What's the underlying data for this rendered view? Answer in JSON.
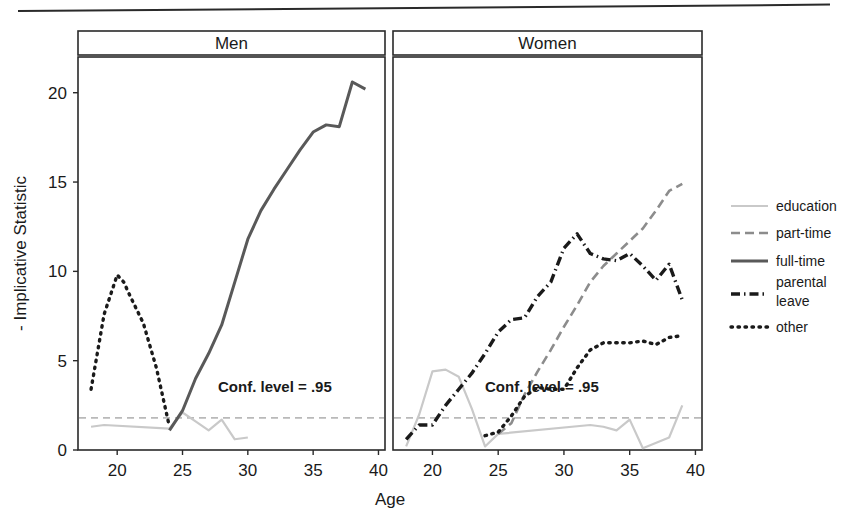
{
  "figure": {
    "top_rule": true,
    "background": "#ffffff"
  },
  "chart_data": {
    "type": "line",
    "title": "",
    "xlabel": "Age",
    "ylabel": "- Implicative Statistic",
    "xlim": [
      17,
      40.5
    ],
    "ylim": [
      0,
      22
    ],
    "xticks": [
      20,
      25,
      30,
      35,
      40
    ],
    "yticks": [
      0,
      5,
      10,
      15,
      20
    ],
    "grid": false,
    "legend_position": "right",
    "panels": [
      {
        "strip_label": "Men",
        "annotation": "Conf. level = .95",
        "series": [
          {
            "name": "education",
            "x": [
              18,
              19,
              24,
              25,
              26,
              27,
              28,
              29,
              30
            ],
            "values": [
              1.3,
              1.4,
              1.2,
              2.1,
              1.6,
              1.1,
              1.7,
              0.6,
              0.7
            ]
          },
          {
            "name": "part-time",
            "x": [],
            "values": []
          },
          {
            "name": "full-time",
            "x": [
              24,
              25,
              26,
              27,
              28,
              29,
              30,
              31,
              32,
              33,
              34,
              35,
              36,
              37,
              38,
              39
            ],
            "values": [
              1.1,
              2.2,
              4.0,
              5.4,
              7.0,
              9.4,
              11.8,
              13.4,
              14.6,
              15.7,
              16.8,
              17.8,
              18.2,
              18.1,
              20.6,
              20.2
            ]
          },
          {
            "name": "parental leave",
            "x": [],
            "values": []
          },
          {
            "name": "other",
            "x": [
              18,
              19,
              20,
              20.5,
              21,
              22,
              23,
              24
            ],
            "values": [
              3.4,
              7.6,
              9.8,
              9.4,
              8.6,
              7.1,
              4.6,
              1.3
            ]
          }
        ]
      },
      {
        "strip_label": "Women",
        "annotation": "Conf. level = .95",
        "series": [
          {
            "name": "education",
            "x": [
              18,
              19,
              20,
              21,
              22,
              23,
              24,
              25,
              32,
              33,
              34,
              35,
              36,
              38,
              39
            ],
            "values": [
              0.2,
              2.0,
              4.4,
              4.5,
              4.1,
              2.3,
              0.2,
              0.9,
              1.4,
              1.3,
              1.1,
              1.7,
              0.1,
              0.7,
              2.5
            ]
          },
          {
            "name": "part-time",
            "x": [
              25,
              26,
              27,
              28,
              29,
              30,
              31,
              32,
              33,
              34,
              35,
              36,
              37,
              38,
              39
            ],
            "values": [
              0.9,
              1.5,
              3.1,
              4.4,
              5.6,
              6.9,
              8.1,
              9.4,
              10.3,
              11.0,
              11.7,
              12.4,
              13.4,
              14.5,
              14.9
            ]
          },
          {
            "name": "full-time",
            "x": [],
            "values": []
          },
          {
            "name": "parental leave",
            "x": [
              18,
              19,
              20,
              21,
              22,
              23,
              24,
              25,
              26,
              27,
              28,
              29,
              30,
              31,
              32,
              33,
              34,
              35,
              36,
              37,
              38,
              39
            ],
            "values": [
              0.6,
              1.4,
              1.4,
              2.5,
              3.4,
              4.3,
              5.4,
              6.6,
              7.3,
              7.4,
              8.6,
              9.4,
              11.3,
              12.1,
              11.0,
              10.7,
              10.6,
              11.0,
              10.3,
              9.5,
              10.4,
              8.4
            ]
          },
          {
            "name": "other",
            "x": [
              24,
              25,
              26,
              27,
              28,
              29,
              30,
              31,
              32,
              33,
              34,
              35,
              36,
              37,
              38,
              39
            ],
            "values": [
              0.8,
              1.0,
              1.9,
              3.0,
              3.5,
              3.4,
              3.4,
              4.6,
              5.6,
              6.0,
              6.0,
              6.0,
              6.1,
              5.9,
              6.3,
              6.4
            ]
          }
        ]
      }
    ],
    "reference_line": {
      "label": "Conf. level = .95",
      "y": 1.8,
      "style": "dashed",
      "color": "#b9b9b9"
    },
    "legend": [
      {
        "label": "education",
        "style": "solid-thin",
        "color": "#c9c9c9"
      },
      {
        "label": "part-time",
        "style": "dashed",
        "color": "#8c8c8c"
      },
      {
        "label": "full-time",
        "style": "solid-thick",
        "color": "#595959"
      },
      {
        "label": "parental leave",
        "style": "dashdot",
        "color": "#1a1a1a"
      },
      {
        "label": "other",
        "style": "dotted",
        "color": "#1a1a1a"
      }
    ]
  }
}
